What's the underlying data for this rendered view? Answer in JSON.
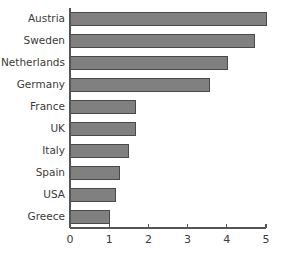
{
  "chart_data": {
    "type": "bar",
    "orientation": "horizontal",
    "title": "",
    "xlabel": "",
    "ylabel": "",
    "categories": [
      "Austria",
      "Sweden",
      "Netherlands",
      "Germany",
      "France",
      "UK",
      "Italy",
      "Spain",
      "USA",
      "Greece"
    ],
    "values": [
      5.0,
      4.7,
      4.03,
      3.55,
      1.68,
      1.66,
      1.5,
      1.27,
      1.15,
      1.0
    ],
    "xlim": [
      0,
      5
    ],
    "xticks": [
      0,
      1,
      2,
      3,
      4,
      5
    ],
    "xtick_labels": [
      "0",
      "1",
      "2",
      "3",
      "4",
      "5"
    ],
    "grid": false,
    "legend": false,
    "bar_color": "#808080",
    "bar_edge_color": "#4a4a4a",
    "axis_color": "#555555",
    "text_color": "#3b3b3b",
    "background": "#ffffff"
  }
}
